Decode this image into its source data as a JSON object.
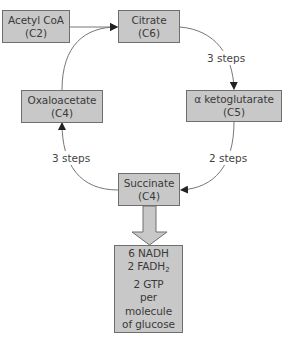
{
  "diagram": {
    "nodes": [
      {
        "id": "acetyl-coa",
        "name": "Acetyl CoA",
        "carbons": "(C2)"
      },
      {
        "id": "citrate",
        "name": "Citrate",
        "carbons": "(C6)"
      },
      {
        "id": "alpha-ketoglutarate",
        "name": "α ketoglutarate",
        "carbons": "(C5)"
      },
      {
        "id": "succinate",
        "name": "Succinate",
        "carbons": "(C4)"
      },
      {
        "id": "oxaloacetate",
        "name": "Oxaloacetate",
        "carbons": "(C4)"
      }
    ],
    "edges": [
      {
        "from": "acetyl-coa",
        "to": "citrate",
        "label": ""
      },
      {
        "from": "citrate",
        "to": "alpha-ketoglutarate",
        "label": "3 steps"
      },
      {
        "from": "alpha-ketoglutarate",
        "to": "succinate",
        "label": "2 steps"
      },
      {
        "from": "succinate",
        "to": "oxaloacetate",
        "label": "3 steps"
      },
      {
        "from": "oxaloacetate",
        "to": "citrate",
        "label": ""
      }
    ],
    "output": {
      "line1": "6 NADH",
      "line2_prefix": "2 FADH",
      "line2_sub": "2",
      "line3": "2 GTP",
      "line4": "per",
      "line5": "molecule",
      "line6": "of glucose"
    },
    "colors": {
      "box_fill": "#c8c8c8",
      "box_border": "#6e6e6e",
      "arrow": "#555555",
      "text": "#3a3a3a"
    }
  }
}
